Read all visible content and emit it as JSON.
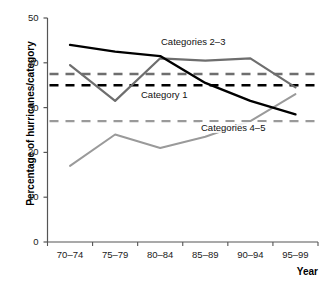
{
  "chart_data": {
    "type": "line",
    "title": "",
    "subtitle": "",
    "xlabel": "Year",
    "ylabel": "Percentage of hurricanes/category",
    "categories": [
      "70–74",
      "75–79",
      "80–84",
      "85–89",
      "90–94",
      "95–99"
    ],
    "xtick_labels": [
      "70–74",
      "75–79",
      "80–84",
      "85–89",
      "90–94",
      "95–99"
    ],
    "ytick_labels": [
      "0",
      "10",
      "20",
      "30",
      "40",
      "50"
    ],
    "ytick_values": [
      0,
      10,
      20,
      30,
      40,
      50
    ],
    "ylim": [
      0,
      50
    ],
    "grid": false,
    "legend": "inline-annotations",
    "series": [
      {
        "name": "Category 1",
        "style": "solid",
        "color": "#000000",
        "width": 2.4,
        "values": [
          44.0,
          42.5,
          41.5,
          35.5,
          31.5,
          28.5
        ]
      },
      {
        "name": "Categories 2–3",
        "style": "solid",
        "color": "#6e6e6e",
        "width": 2.2,
        "values": [
          39.5,
          31.5,
          41.0,
          40.5,
          41.0,
          34.5
        ]
      },
      {
        "name": "Categories 4–5",
        "style": "solid",
        "color": "#9a9a9a",
        "width": 2.0,
        "values": [
          17.0,
          24.0,
          21.0,
          23.5,
          27.0,
          33.0
        ]
      }
    ],
    "reference_lines": [
      {
        "name": "Categories 2–3 mean",
        "style": "dashed",
        "color": "#6e6e6e",
        "width": 2.4,
        "value": 37.5
      },
      {
        "name": "Category 1 mean",
        "style": "dashed",
        "color": "#000000",
        "width": 2.6,
        "value": 35.0
      },
      {
        "name": "Categories 4–5 mean",
        "style": "dashed",
        "color": "#9a9a9a",
        "width": 2.2,
        "value": 27.0
      }
    ],
    "annotations": [
      {
        "text": "Categories 2–3",
        "x": 160,
        "y": 36
      },
      {
        "text": "Category 1",
        "x": 140,
        "y": 89
      },
      {
        "text": "Categories 4–5",
        "x": 200,
        "y": 122
      }
    ]
  },
  "axes": {
    "y_title": "Percentage of hurricanes/category",
    "x_title": "Year",
    "y_ticks": [
      {
        "label": "50"
      },
      {
        "label": "40"
      },
      {
        "label": "30"
      },
      {
        "label": "20"
      },
      {
        "label": "10"
      },
      {
        "label": "0"
      }
    ],
    "x_ticks": [
      {
        "label": "70–74"
      },
      {
        "label": "75–79"
      },
      {
        "label": "80–84"
      },
      {
        "label": "85–89"
      },
      {
        "label": "90–94"
      },
      {
        "label": "95–99"
      }
    ]
  },
  "annotations": {
    "cat23": "Categories 2–3",
    "cat1": "Category 1",
    "cat45": "Categories 4–5"
  },
  "colors": {
    "axis": "#555555",
    "cat1": "#000000",
    "cat23": "#6e6e6e",
    "cat45": "#9a9a9a",
    "background": "#ffffff"
  }
}
